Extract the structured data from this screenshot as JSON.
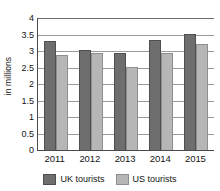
{
  "chart_data": {
    "type": "bar",
    "title": "",
    "xlabel": "",
    "ylabel": "in millions",
    "categories": [
      "2011",
      "2012",
      "2013",
      "2014",
      "2015"
    ],
    "series": [
      {
        "name": "UK tourists",
        "values": [
          3.3,
          3.03,
          2.94,
          3.33,
          3.52
        ],
        "color": "#6e6e6e"
      },
      {
        "name": "US tourists",
        "values": [
          2.88,
          2.94,
          2.51,
          2.94,
          3.21
        ],
        "color": "#b6b6b6"
      }
    ],
    "ylim": [
      0,
      4
    ],
    "yticks": [
      "0",
      "0.5",
      "1",
      "1.5",
      "2",
      "2.5",
      "3",
      "3.5",
      "4"
    ],
    "ytick_values": [
      0,
      0.5,
      1,
      1.5,
      2,
      2.5,
      3,
      3.5,
      4
    ],
    "grid": true,
    "grid_axis": "y",
    "legend_position": "bottom"
  }
}
